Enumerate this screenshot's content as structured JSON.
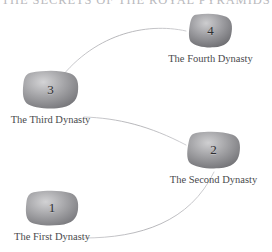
{
  "title": "THE SECRETS OF THE ROYAL PYRAMIDS",
  "colors": {
    "background": "#ffffff",
    "title_text": "#b9b9bd",
    "label_text": "#4a4a4d",
    "number_text": "#2e2e30",
    "connector_line": "#b0b0b4",
    "stone_light": "#c9c9cb",
    "stone_mid": "#9b9b9e",
    "stone_dark": "#6f6f73"
  },
  "nodes": [
    {
      "id": "node-1",
      "number": "1",
      "label": "The First Dynasty",
      "x": 25,
      "y": 190,
      "w": 54,
      "h": 36
    },
    {
      "id": "node-2",
      "number": "2",
      "label": "The Second Dynasty",
      "x": 186,
      "y": 131,
      "w": 55,
      "h": 38
    },
    {
      "id": "node-3",
      "number": "3",
      "label": "The Third Dynasty",
      "x": 22,
      "y": 70,
      "w": 57,
      "h": 39
    },
    {
      "id": "node-4",
      "number": "4",
      "label": "The Fourth Dynasty",
      "x": 188,
      "y": 13,
      "w": 45,
      "h": 35
    }
  ],
  "connectors": [
    {
      "id": "connector-1-to-2",
      "from": "node-1",
      "to": "node-2"
    },
    {
      "id": "connector-2-to-3",
      "from": "node-2",
      "to": "node-3"
    },
    {
      "id": "connector-3-to-4",
      "from": "node-3",
      "to": "node-4"
    }
  ]
}
